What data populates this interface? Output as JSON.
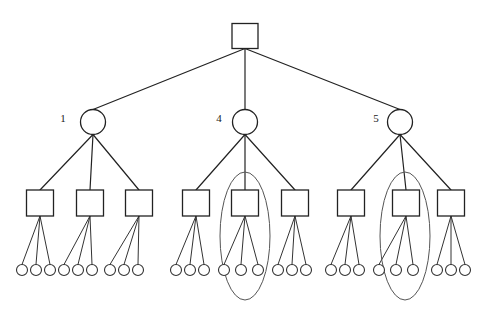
{
  "diagram": {
    "type": "hierarchical-tree",
    "canvas": {
      "width": 487,
      "height": 326,
      "background": "#ffffff"
    },
    "stroke_color": "#222222",
    "fill_color": "#ffffff",
    "highlight_color": "#555555",
    "levels": [
      {
        "index": 0,
        "shape": "square",
        "count": 1
      },
      {
        "index": 1,
        "shape": "circle",
        "count": 3
      },
      {
        "index": 2,
        "shape": "square",
        "count": 9
      },
      {
        "index": 3,
        "shape": "circle",
        "count": 27
      }
    ],
    "root": {
      "id": "root",
      "shape": "square",
      "label": "",
      "cx": 245,
      "cy": 36,
      "w": 26,
      "h": 25
    },
    "level1": [
      {
        "id": "n1",
        "shape": "circle",
        "label": "1",
        "cx": 93,
        "cy": 122,
        "r": 12.5,
        "label_x": 63,
        "label_y": 119
      },
      {
        "id": "n4",
        "shape": "circle",
        "label": "4",
        "cx": 245,
        "cy": 122,
        "r": 12.5,
        "label_x": 219,
        "label_y": 119
      },
      {
        "id": "n5",
        "shape": "circle",
        "label": "5",
        "cx": 400,
        "cy": 122,
        "r": 12.5,
        "label_x": 376,
        "label_y": 119
      }
    ],
    "level2": [
      {
        "id": "s1",
        "parent": "n1",
        "label": "",
        "cx": 40,
        "cy": 203,
        "w": 27,
        "h": 26,
        "highlighted": false
      },
      {
        "id": "s2",
        "parent": "n1",
        "label": "",
        "cx": 90,
        "cy": 203,
        "w": 27,
        "h": 26,
        "highlighted": false
      },
      {
        "id": "s3",
        "parent": "n1",
        "label": "",
        "cx": 139,
        "cy": 203,
        "w": 27,
        "h": 26,
        "highlighted": false
      },
      {
        "id": "s4",
        "parent": "n4",
        "label": "",
        "cx": 196,
        "cy": 203,
        "w": 27,
        "h": 26,
        "highlighted": false
      },
      {
        "id": "s5",
        "parent": "n4",
        "label": "",
        "cx": 245,
        "cy": 203,
        "w": 27,
        "h": 26,
        "highlighted": true
      },
      {
        "id": "s6",
        "parent": "n4",
        "label": "",
        "cx": 295,
        "cy": 203,
        "w": 27,
        "h": 26,
        "highlighted": false
      },
      {
        "id": "s7",
        "parent": "n5",
        "label": "",
        "cx": 351,
        "cy": 203,
        "w": 27,
        "h": 26,
        "highlighted": false
      },
      {
        "id": "s8",
        "parent": "n5",
        "label": "",
        "cx": 406,
        "cy": 203,
        "w": 27,
        "h": 26,
        "highlighted": true
      },
      {
        "id": "s9",
        "parent": "n5",
        "label": "",
        "cx": 451,
        "cy": 203,
        "w": 27,
        "h": 26,
        "highlighted": false
      }
    ],
    "level3": [
      {
        "id": "l1",
        "parent": "s1",
        "cx": 22,
        "cy": 270,
        "r": 5.5
      },
      {
        "id": "l2",
        "parent": "s1",
        "cx": 36,
        "cy": 270,
        "r": 5.5
      },
      {
        "id": "l3",
        "parent": "s1",
        "cx": 50,
        "cy": 270,
        "r": 5.5
      },
      {
        "id": "l4",
        "parent": "s2",
        "cx": 64,
        "cy": 270,
        "r": 5.5
      },
      {
        "id": "l5",
        "parent": "s2",
        "cx": 78,
        "cy": 270,
        "r": 5.5
      },
      {
        "id": "l6",
        "parent": "s2",
        "cx": 92,
        "cy": 270,
        "r": 5.5
      },
      {
        "id": "l7",
        "parent": "s3",
        "cx": 110,
        "cy": 270,
        "r": 5.5
      },
      {
        "id": "l8",
        "parent": "s3",
        "cx": 124,
        "cy": 270,
        "r": 5.5
      },
      {
        "id": "l9",
        "parent": "s3",
        "cx": 138,
        "cy": 270,
        "r": 5.5
      },
      {
        "id": "l10",
        "parent": "s4",
        "cx": 176,
        "cy": 270,
        "r": 5.5
      },
      {
        "id": "l11",
        "parent": "s4",
        "cx": 190,
        "cy": 270,
        "r": 5.5
      },
      {
        "id": "l12",
        "parent": "s4",
        "cx": 204,
        "cy": 270,
        "r": 5.5
      },
      {
        "id": "l13",
        "parent": "s5",
        "cx": 224,
        "cy": 270,
        "r": 5.5
      },
      {
        "id": "l14",
        "parent": "s5",
        "cx": 241,
        "cy": 270,
        "r": 5.5
      },
      {
        "id": "l15",
        "parent": "s5",
        "cx": 258,
        "cy": 270,
        "r": 5.5
      },
      {
        "id": "l16",
        "parent": "s6",
        "cx": 278,
        "cy": 270,
        "r": 5.5
      },
      {
        "id": "l17",
        "parent": "s6",
        "cx": 292,
        "cy": 270,
        "r": 5.5
      },
      {
        "id": "l18",
        "parent": "s6",
        "cx": 306,
        "cy": 270,
        "r": 5.5
      },
      {
        "id": "l19",
        "parent": "s7",
        "cx": 331,
        "cy": 270,
        "r": 5.5
      },
      {
        "id": "l20",
        "parent": "s7",
        "cx": 345,
        "cy": 270,
        "r": 5.5
      },
      {
        "id": "l21",
        "parent": "s7",
        "cx": 359,
        "cy": 270,
        "r": 5.5
      },
      {
        "id": "l22",
        "parent": "s8",
        "cx": 379,
        "cy": 270,
        "r": 5.5
      },
      {
        "id": "l23",
        "parent": "s8",
        "cx": 396,
        "cy": 270,
        "r": 5.5
      },
      {
        "id": "l24",
        "parent": "s8",
        "cx": 413,
        "cy": 270,
        "r": 5.5
      },
      {
        "id": "l25",
        "parent": "s9",
        "cx": 437,
        "cy": 270,
        "r": 5.5
      },
      {
        "id": "l26",
        "parent": "s9",
        "cx": 451,
        "cy": 270,
        "r": 5.5
      },
      {
        "id": "l27",
        "parent": "s9",
        "cx": 465,
        "cy": 270,
        "r": 5.5
      }
    ],
    "ellipses": [
      {
        "id": "e1",
        "around": "s5",
        "cx": 245,
        "cy": 236,
        "rx": 25,
        "ry": 64
      },
      {
        "id": "e2",
        "around": "s8",
        "cx": 405,
        "cy": 236,
        "rx": 25,
        "ry": 64
      }
    ]
  }
}
